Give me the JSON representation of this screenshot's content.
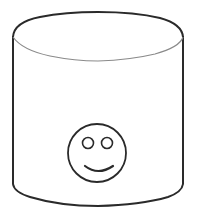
{
  "diagram": {
    "type": "cylinder-with-smiley",
    "shape": "database-cylinder",
    "icon": "smiley-face-icon",
    "colors": {
      "stroke": "#2a2a2a",
      "inner_rim_stroke": "#8a8a8a",
      "fill": "#ffffff",
      "background": "#ffffff"
    }
  }
}
